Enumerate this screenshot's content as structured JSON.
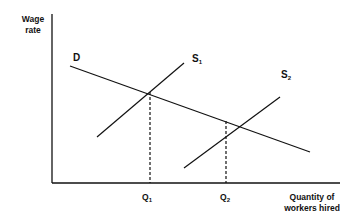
{
  "diagram": {
    "y_axis_label_line1": "Wage",
    "y_axis_label_line2": "rate",
    "x_axis_label_line1": "Quantity of",
    "x_axis_label_line2": "workers hired",
    "curves": {
      "demand": {
        "label": "D"
      },
      "supply1": {
        "label": "S",
        "subscript": "1"
      },
      "supply2": {
        "label": "S",
        "subscript": "2"
      }
    },
    "ticks": {
      "q1": {
        "label": "Q",
        "subscript": "1"
      },
      "q2": {
        "label": "Q",
        "subscript": "2"
      }
    }
  }
}
